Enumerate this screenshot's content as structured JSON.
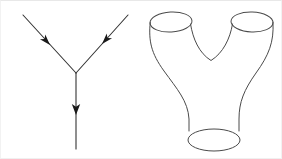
{
  "figure": {
    "title": "String interaction: three-point vertex and pair-of-pants worldsheet",
    "width": 282,
    "height": 159,
    "background_color": "#ffffff",
    "line_color": "#333333",
    "curve_color": "#4a4a4a",
    "arrow_color": "#1a1a1a"
  },
  "panels": [
    {
      "id": "feynman-vertex",
      "name": "Feynman three-point vertex diagram",
      "type": "line-diagram",
      "vertex": {
        "x": 75,
        "y": 72
      },
      "legs": [
        {
          "id": "incoming-left",
          "label": "incoming left particle line",
          "from": {
            "x": 22,
            "y": 14
          },
          "to": {
            "x": 75,
            "y": 72
          },
          "direction": "toward-vertex",
          "arrow_at": {
            "x": 48,
            "y": 43
          },
          "arrow_angle_deg": 48
        },
        {
          "id": "incoming-right",
          "label": "incoming right particle line",
          "from": {
            "x": 127,
            "y": 14
          },
          "to": {
            "x": 75,
            "y": 72
          },
          "direction": "toward-vertex",
          "arrow_at": {
            "x": 101,
            "y": 43
          },
          "arrow_angle_deg": 132
        },
        {
          "id": "outgoing-down",
          "label": "outgoing particle line",
          "from": {
            "x": 75,
            "y": 72
          },
          "to": {
            "x": 75,
            "y": 148
          },
          "direction": "away-from-vertex",
          "arrow_at": {
            "x": 75,
            "y": 112
          },
          "arrow_angle_deg": 90
        }
      ]
    },
    {
      "id": "pair-of-pants",
      "name": "Pair-of-pants worldsheet surface",
      "type": "surface-diagram",
      "openings": [
        {
          "id": "top-left-opening",
          "label": "upper left tube opening",
          "cx": 170,
          "cy": 21,
          "rx": 21,
          "ry": 10,
          "rotation_deg": -3
        },
        {
          "id": "top-right-opening",
          "label": "upper right tube opening",
          "cx": 251,
          "cy": 21,
          "rx": 21,
          "ry": 10,
          "rotation_deg": 2
        },
        {
          "id": "bottom-opening",
          "label": "lower tube opening",
          "cx": 213,
          "cy": 139,
          "rx": 26,
          "ry": 11,
          "rotation_deg": 0
        }
      ],
      "contours": [
        {
          "id": "outer-left-contour",
          "label": "left outer silhouette from upper-left tube to bottom tube"
        },
        {
          "id": "outer-right-contour",
          "label": "right outer silhouette from upper-right tube to bottom tube"
        },
        {
          "id": "saddle-curve",
          "label": "inner crotch saddle curve joining the two legs",
          "lowest_point": {
            "x": 210,
            "y": 60
          }
        },
        {
          "id": "bottom-left-wall",
          "label": "left wall of lower tube"
        },
        {
          "id": "bottom-right-wall",
          "label": "right wall of lower tube"
        }
      ]
    }
  ]
}
